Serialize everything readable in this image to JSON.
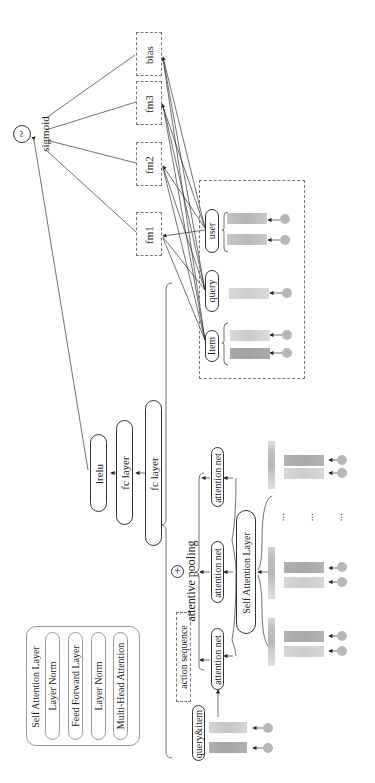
{
  "diagram": {
    "orientation": "rotated 90 degrees counter-clockwise",
    "output": {
      "symbol": "~",
      "label": "sigmoid"
    },
    "fm_boxes": [
      {
        "id": "bias",
        "label": "bias"
      },
      {
        "id": "fm3",
        "label": "fm3"
      },
      {
        "id": "fm2",
        "label": "fm2"
      },
      {
        "id": "fm1",
        "label": "fm1"
      }
    ],
    "feature_group": {
      "fields": [
        {
          "id": "user",
          "label": "user",
          "embeddings": 2
        },
        {
          "id": "query",
          "label": "query",
          "embeddings": 1
        },
        {
          "id": "item",
          "label": "Item",
          "embeddings": 2
        }
      ]
    },
    "mlp": [
      {
        "id": "lrelu",
        "label": "lrelu"
      },
      {
        "id": "fc1",
        "label": "fc layer"
      },
      {
        "id": "fc2",
        "label": "fc layer"
      }
    ],
    "pooling": {
      "symbol": "+",
      "label": "attentive pooling"
    },
    "attention_nets": [
      {
        "label": "attention net"
      },
      {
        "label": "attention net"
      },
      {
        "label": "attention net"
      }
    ],
    "self_attention": {
      "label": "Self Attention Layer"
    },
    "action_sequence": {
      "label": "action sequence"
    },
    "query_item": {
      "label": "query&item"
    },
    "ellipsis": "...",
    "legend": {
      "title": "Self Attention Layer",
      "items": [
        {
          "label": "Layer Norm"
        },
        {
          "label": "Feed Forward Layer"
        },
        {
          "label": "Layer Norm"
        },
        {
          "label": "Multi-Head Attention"
        }
      ]
    },
    "colors": {
      "line": "#333333",
      "dashed_border": "#777777",
      "embedding_dark": "#a9a9a9",
      "embedding_light": "#d2d2d2",
      "node_circle": "#b7b7b7"
    }
  }
}
